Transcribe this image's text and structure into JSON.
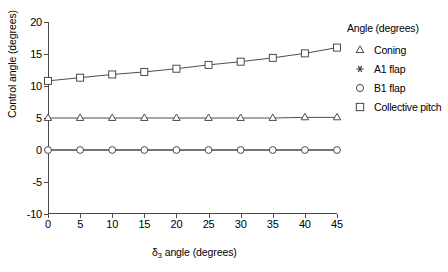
{
  "chart_data": {
    "type": "line",
    "title": "",
    "xlabel": "δ₃ angle (degrees)",
    "xlabel_base": "δ",
    "xlabel_sub": "3",
    "xlabel_rest": " angle (degrees)",
    "ylabel": "Control angle (degrees)",
    "xlim": [
      0,
      45
    ],
    "ylim": [
      -10,
      20
    ],
    "xticks": [
      0,
      5,
      10,
      15,
      20,
      25,
      30,
      35,
      40,
      45
    ],
    "yticks": [
      -10,
      -5,
      0,
      5,
      10,
      15,
      20
    ],
    "xtick_labels": [
      "0",
      "5",
      "10",
      "15",
      "20",
      "25",
      "30",
      "35",
      "40",
      "45"
    ],
    "ytick_labels": [
      "-10",
      "-5",
      "0",
      "5",
      "10",
      "15",
      "20"
    ],
    "grid": false,
    "legend_position": "right",
    "legend_title": "Angle (degrees)",
    "x": [
      0,
      5,
      10,
      15,
      20,
      25,
      30,
      35,
      40,
      45
    ],
    "series": [
      {
        "name": "Coning",
        "marker": "triangle",
        "values": [
          5.0,
          5.0,
          5.0,
          5.0,
          5.0,
          5.0,
          5.0,
          5.0,
          5.1,
          5.1
        ]
      },
      {
        "name": "A1 flap",
        "marker": "asterisk",
        "values": [
          0.0,
          0.0,
          0.0,
          0.0,
          0.0,
          0.0,
          0.0,
          0.0,
          0.0,
          0.0
        ]
      },
      {
        "name": "B1 flap",
        "marker": "circle",
        "values": [
          0.0,
          0.0,
          0.0,
          0.0,
          0.0,
          0.0,
          0.0,
          0.0,
          0.0,
          0.0
        ]
      },
      {
        "name": "Collective pitch",
        "marker": "square",
        "values": [
          10.8,
          11.3,
          11.8,
          12.2,
          12.7,
          13.3,
          13.8,
          14.4,
          15.1,
          16.0
        ]
      }
    ]
  },
  "legend": {
    "title": "Angle (degrees)",
    "items": [
      {
        "label": "Coning",
        "marker": "triangle"
      },
      {
        "label": "A1 flap",
        "marker": "asterisk"
      },
      {
        "label": "B1 flap",
        "marker": "circle"
      },
      {
        "label": "Collective pitch",
        "marker": "square"
      }
    ]
  },
  "colors": {
    "axis": "#4a4a4a",
    "line": "#3a3a3a",
    "marker_stroke": "#3a3a3a",
    "background": "#ffffff"
  }
}
